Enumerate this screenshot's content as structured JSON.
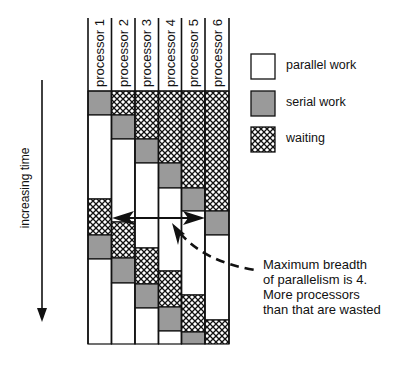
{
  "diagram": {
    "time_axis_label": "increasing time",
    "processors": [
      {
        "label": "processor 1",
        "segments": [
          [
            "serial",
            91,
            115
          ],
          [
            "parallel",
            115,
            199
          ],
          [
            "waiting",
            199,
            235
          ],
          [
            "serial",
            235,
            259
          ],
          [
            "parallel",
            259,
            344
          ]
        ]
      },
      {
        "label": "processor 2",
        "segments": [
          [
            "waiting",
            91,
            115
          ],
          [
            "serial",
            115,
            139
          ],
          [
            "parallel",
            139,
            222
          ],
          [
            "waiting",
            222,
            258
          ],
          [
            "serial",
            258,
            283
          ],
          [
            "parallel",
            283,
            344
          ]
        ]
      },
      {
        "label": "processor 3",
        "segments": [
          [
            "waiting",
            91,
            139
          ],
          [
            "serial",
            139,
            163
          ],
          [
            "parallel",
            163,
            248
          ],
          [
            "waiting",
            248,
            284
          ],
          [
            "serial",
            284,
            308
          ],
          [
            "parallel",
            308,
            344
          ]
        ]
      },
      {
        "label": "processor 4",
        "segments": [
          [
            "waiting",
            91,
            163
          ],
          [
            "serial",
            163,
            188
          ],
          [
            "parallel",
            188,
            271
          ],
          [
            "waiting",
            271,
            307
          ],
          [
            "serial",
            307,
            331
          ],
          [
            "parallel",
            331,
            344
          ]
        ]
      },
      {
        "label": "processor 5",
        "segments": [
          [
            "waiting",
            91,
            188
          ],
          [
            "serial",
            188,
            211
          ],
          [
            "parallel",
            211,
            295
          ],
          [
            "waiting",
            295,
            332
          ],
          [
            "serial",
            332,
            344
          ]
        ]
      },
      {
        "label": "processor 6",
        "segments": [
          [
            "waiting",
            91,
            211
          ],
          [
            "serial",
            211,
            235
          ],
          [
            "parallel",
            235,
            320
          ],
          [
            "waiting",
            320,
            344
          ]
        ]
      }
    ],
    "legend": [
      {
        "key": "parallel",
        "label": "parallel work"
      },
      {
        "key": "serial",
        "label": "serial work"
      },
      {
        "key": "waiting",
        "label": "waiting"
      }
    ],
    "annotation": {
      "lines": [
        "Maximum breadth",
        "of parallelism is 4.",
        "More processors",
        "than that are wasted"
      ]
    },
    "colors": {
      "serial": "#9a9a9a",
      "parallel": "#ffffff",
      "waiting_line": "#111111",
      "stroke": "#111111"
    }
  }
}
